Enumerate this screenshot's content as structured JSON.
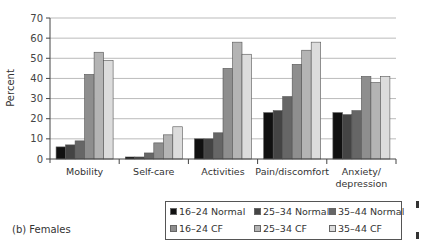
{
  "chart_data": {
    "type": "bar",
    "title": "",
    "caption": "(b) Females",
    "xlabel": "",
    "ylabel": "Percent",
    "ylim": [
      0,
      70
    ],
    "yticks": [
      0,
      10,
      20,
      30,
      40,
      50,
      60,
      70
    ],
    "grid": true,
    "legend_position": "bottom-right",
    "categories": [
      "Mobility",
      "Self-care",
      "Activities",
      "Pain/discomfort",
      "Anxiety/\ndepression"
    ],
    "series": [
      {
        "name": "16–24 Normal",
        "color": "#111111",
        "values": [
          6,
          1,
          10,
          23,
          23
        ]
      },
      {
        "name": "25–34 Normal",
        "color": "#444444",
        "values": [
          7,
          1,
          10,
          24,
          22
        ]
      },
      {
        "name": "35–44 Normal",
        "color": "#666666",
        "values": [
          9,
          3,
          13,
          31,
          24
        ]
      },
      {
        "name": "16–24 CF",
        "color": "#8e8e8e",
        "values": [
          42,
          8,
          45,
          47,
          41
        ]
      },
      {
        "name": "25–34 CF",
        "color": "#b4b4b4",
        "values": [
          53,
          12,
          58,
          54,
          38
        ]
      },
      {
        "name": "35–44 CF",
        "color": "#dcdcdc",
        "values": [
          49,
          16,
          52,
          58,
          41
        ]
      }
    ]
  }
}
